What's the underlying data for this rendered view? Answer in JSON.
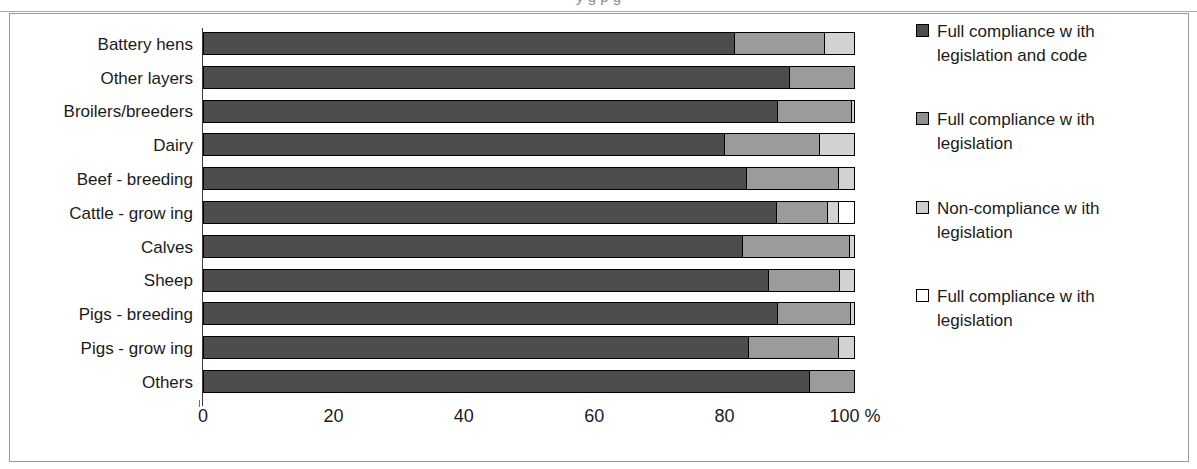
{
  "figure": {
    "frame_border_color": "#9a9a9a",
    "background": "#ffffff",
    "title_fragment": "y                                         g  p   g"
  },
  "axis": {
    "x_ticks": [
      "0",
      "20",
      "40",
      "60",
      "80",
      "100 %"
    ],
    "x_tick_values": [
      0,
      20,
      40,
      60,
      80,
      100
    ],
    "x_unit": "%"
  },
  "legend": {
    "items": [
      {
        "label": "Full compliance w ith legislation and code",
        "color": "#4d4d4d",
        "key": "full-compliance-legislation-and-code"
      },
      {
        "label": "Full compliance w ith legislation",
        "color": "#8f8f8f",
        "key": "full-compliance-legislation"
      },
      {
        "label": "Non-compliance w ith legislation",
        "color": "#cdcdcd",
        "key": "non-compliance-legislation"
      },
      {
        "label": "Full compliance w ith legislation",
        "color": "#ffffff",
        "key": "full-compliance-legislation-white"
      }
    ]
  },
  "chart_data": {
    "type": "bar",
    "orientation": "horizontal",
    "stacked": true,
    "normalized_percent": true,
    "title": "",
    "xlabel": "%",
    "ylabel": "",
    "xlim": [
      0,
      100
    ],
    "grid": false,
    "legend_position": "right",
    "categories": [
      "Battery hens",
      "Other layers",
      "Broilers/breeders",
      "Dairy",
      "Beef - breeding",
      "Cattle - grow ing",
      "Calves",
      "Sheep",
      "Pigs - breeding",
      "Pigs - grow ing",
      "Others"
    ],
    "series": [
      {
        "name": "Full compliance w ith legislation and code",
        "color": "#4d4d4d",
        "values": [
          81.5,
          90.0,
          88.2,
          80.0,
          83.4,
          88.0,
          82.7,
          86.7,
          88.2,
          83.7,
          93.1
        ]
      },
      {
        "name": "Full compliance w ith legislation",
        "color": "#9b9b9b",
        "values": [
          13.9,
          10.0,
          11.3,
          14.6,
          14.2,
          7.8,
          16.6,
          11.0,
          11.2,
          13.8,
          6.9
        ]
      },
      {
        "name": "Non-compliance w ith legislation",
        "color": "#d2d2d2",
        "values": [
          4.6,
          0.0,
          0.5,
          5.4,
          2.4,
          1.8,
          0.7,
          2.3,
          0.6,
          2.5,
          0.0
        ]
      },
      {
        "name": "Full compliance w ith legislation",
        "color": "#ffffff",
        "values": [
          0.0,
          0.0,
          0.0,
          0.0,
          0.0,
          2.4,
          0.0,
          0.0,
          0.0,
          0.0,
          0.0
        ]
      }
    ]
  }
}
